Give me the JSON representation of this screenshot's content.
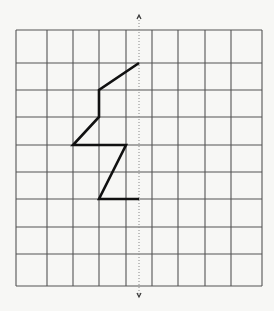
{
  "diagram": {
    "type": "grid-reflection",
    "grid": {
      "columns": 9,
      "rows": 9
    },
    "colors": {
      "background": "#f7f7f5",
      "grid_line": "#555555",
      "shape": "#111111",
      "mirror_line": "#888888"
    },
    "mirror_line": {
      "orientation": "vertical",
      "position_grid_x": 4.5,
      "style": "dotted",
      "arrow_ends": [
        "up",
        "down"
      ]
    },
    "shape": {
      "kind": "polyline",
      "points_grid": [
        [
          4.5,
          1
        ],
        [
          3,
          2
        ],
        [
          3,
          3
        ],
        [
          2,
          4
        ],
        [
          4,
          4
        ],
        [
          3,
          6
        ],
        [
          4.5,
          6
        ]
      ]
    }
  }
}
